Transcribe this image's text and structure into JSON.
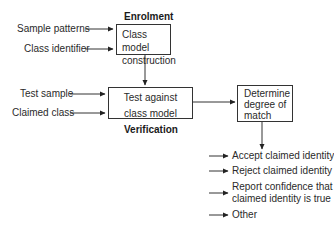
{
  "diagram": {
    "sections": {
      "enrolment": "Enrolment",
      "verification": "Verification"
    },
    "enrolment_inputs": [
      "Sample patterns",
      "Class identifier"
    ],
    "class_model_box": {
      "line1": "Class model",
      "line2": "construction"
    },
    "verification_inputs": [
      "Test sample",
      "Claimed class"
    ],
    "test_box": {
      "line1": "Test against",
      "line2": "class model"
    },
    "match_box": {
      "line1": "Determine",
      "line2": "degree of",
      "line3": "match"
    },
    "outcomes": [
      "Accept claimed identity",
      "Reject claimed identity",
      "Report confidence that claimed identity is true",
      "Other"
    ],
    "outcome_lines": {
      "report_line1": "Report confidence that",
      "report_line2": "claimed identity is true"
    }
  }
}
